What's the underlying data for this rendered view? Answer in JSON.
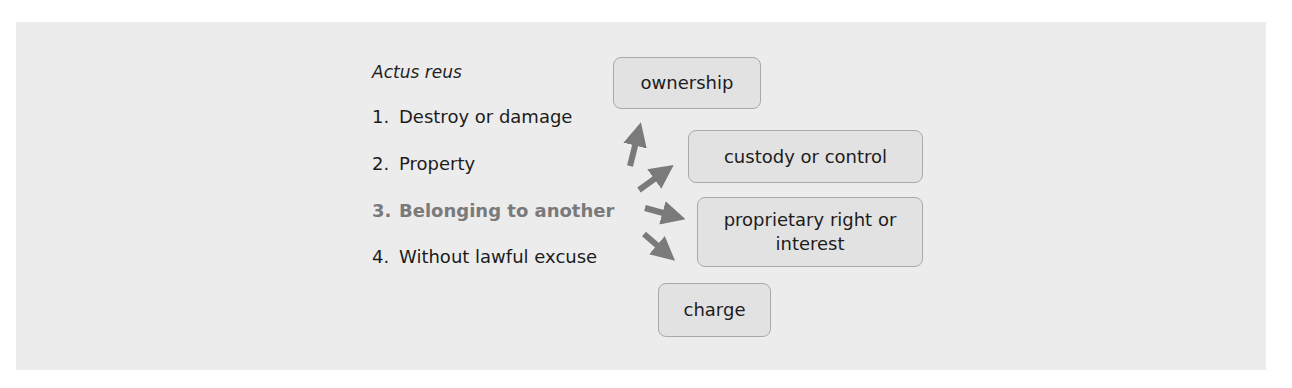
{
  "diagram": {
    "heading": "Actus reus",
    "elements": [
      {
        "num": "1.",
        "label": "Destroy or damage",
        "highlighted": false
      },
      {
        "num": "2.",
        "label": "Property",
        "highlighted": false
      },
      {
        "num": "3.",
        "label": "Belonging to another",
        "highlighted": true
      },
      {
        "num": "4.",
        "label": "Without lawful excuse",
        "highlighted": false
      }
    ],
    "boxes": [
      {
        "label": "ownership"
      },
      {
        "label": "custody or control"
      },
      {
        "label": "proprietary right or interest"
      },
      {
        "label": "charge"
      }
    ],
    "colors": {
      "panel": "#ececec",
      "arrow": "#7a7a7a",
      "highlight_text": "#7a7a7a",
      "box_fill": "#e2e2e2",
      "box_border": "#a9a9a9"
    }
  }
}
